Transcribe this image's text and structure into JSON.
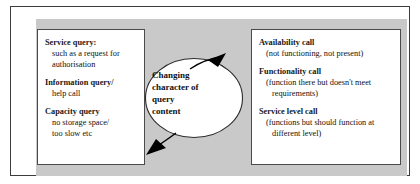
{
  "figure": {
    "colors": {
      "panel_background": "#c9c9c9",
      "box_background": "#ffffff",
      "frame_border": "#3c3c3c",
      "box_border": "#4a4a4a",
      "text": "#111111",
      "arrow": "#000000"
    }
  },
  "left_box": {
    "groups": [
      {
        "heading": "Service query:",
        "lines": [
          "such as a request for",
          "authorisation"
        ]
      },
      {
        "heading": "Information query/",
        "lines": [
          "help call"
        ]
      },
      {
        "heading": "Capacity query",
        "lines": [
          "no storage space/",
          "too slow etc"
        ]
      }
    ]
  },
  "center": {
    "label_lines": [
      "Changing",
      "character of",
      "query",
      "content"
    ],
    "label_text": "Changing character of query content"
  },
  "right_box": {
    "groups": [
      {
        "heading": "Availability call",
        "lines": [
          "(not functioning, not present)"
        ]
      },
      {
        "heading": "Functionality call",
        "lines": [
          "(function there but doesn't meet",
          "requirements)"
        ]
      },
      {
        "heading": "Service level call",
        "lines": [
          "(functions but should function at",
          "different level)"
        ]
      }
    ]
  },
  "arrows": [
    {
      "name": "arrow-to-right-box",
      "direction": "up-right"
    },
    {
      "name": "arrow-to-left-box",
      "direction": "down-left"
    }
  ]
}
